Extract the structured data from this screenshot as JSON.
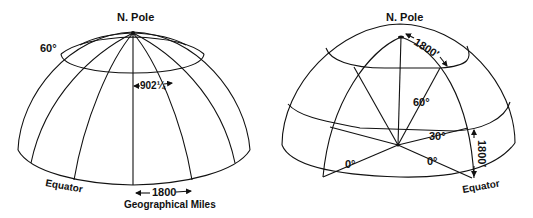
{
  "left_diagram": {
    "pole_label": "N. Pole",
    "parallel_label": "60°",
    "meridian_spacing_label": "902¼",
    "equator_label": "Equator",
    "equator_distance_label": "1800",
    "units_label": "Geographical Miles"
  },
  "right_diagram": {
    "pole_label": "N. Pole",
    "arc_top_label": "1800′",
    "angle_60_label": "60°",
    "angle_30_label": "30°",
    "angle_0_left_label": "0°",
    "angle_0_right_label": "0°",
    "arc_side_label": "1800′",
    "equator_label": "Equator"
  },
  "colors": {
    "ink": "#111111",
    "background": "#ffffff"
  }
}
